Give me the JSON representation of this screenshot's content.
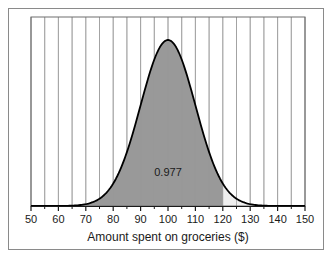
{
  "chart_data": {
    "type": "area",
    "title": "",
    "subtitle": "",
    "xlabel": "Amount spent on groceries ($)",
    "ylabel": "",
    "xlim": [
      50,
      150
    ],
    "ylim": [
      0,
      1
    ],
    "grid": true,
    "grid_axis": "x",
    "grid_step": 5,
    "legend": "none",
    "distribution": {
      "kind": "normal",
      "mean": 100,
      "sd": 10
    },
    "x_ticks": [
      50,
      60,
      70,
      80,
      90,
      100,
      110,
      120,
      130,
      140,
      150
    ],
    "x_tick_labels": [
      "50",
      "60",
      "70",
      "80",
      "90",
      "100",
      "110",
      "120",
      "130",
      "140",
      "150"
    ],
    "x_minor_ticks": [
      55,
      65,
      75,
      85,
      95,
      105,
      115,
      125,
      135,
      145
    ],
    "gridline_values": [
      50,
      55,
      60,
      65,
      70,
      75,
      80,
      85,
      90,
      95,
      100,
      105,
      110,
      115,
      120,
      125,
      130,
      135,
      140,
      145,
      150
    ],
    "y_ticks": [],
    "y_tick_labels": [],
    "shaded_region": {
      "from": 50,
      "to": 120,
      "fill_color": "#999999",
      "edge_color": "#000000"
    },
    "unshaded_region": {
      "from": 120,
      "to": 150,
      "fill_color": "#efefef"
    },
    "annotations": [
      {
        "text": "0.977",
        "x": 100,
        "y": 0.18,
        "name": "probability-label"
      }
    ],
    "curve_color": "#000000",
    "plot_background": "#ffffff",
    "frame_color": "#8a8a8a"
  }
}
